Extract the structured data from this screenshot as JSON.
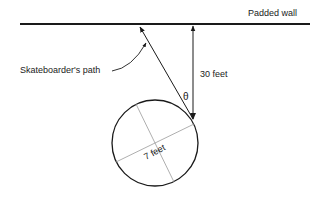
{
  "labels": {
    "wall": "Padded wall",
    "path": "Skateboarder's path",
    "distance": "30 feet",
    "angle": "θ",
    "diameter": "7 feet"
  },
  "colors": {
    "ink": "#1a1a1a",
    "diameter_lines": "#9a9a9a"
  }
}
